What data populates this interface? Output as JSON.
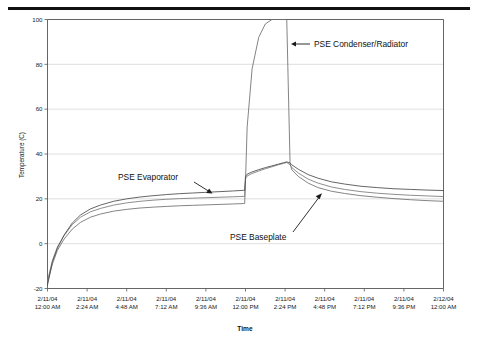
{
  "figure": {
    "top_rule": "horizontal-rule",
    "background": "#ffffff"
  },
  "chart_data": {
    "type": "line",
    "title": "",
    "xlabel": "Time",
    "ylabel": "Temperature (C)",
    "ylim": [
      -20,
      100
    ],
    "yticks": [
      -20,
      0,
      20,
      40,
      60,
      80,
      100
    ],
    "ytick_labels": [
      "-20",
      "0",
      "20",
      "40",
      "60",
      "80",
      "100"
    ],
    "grid": "horizontal",
    "legend_position": "inline-annotations",
    "xtick_labels": [
      {
        "date": "2/11/04",
        "time": "12:00 AM"
      },
      {
        "date": "2/11/04",
        "time": "2:24 AM"
      },
      {
        "date": "2/11/04",
        "time": "4:48 AM"
      },
      {
        "date": "2/11/04",
        "time": "7:12 AM"
      },
      {
        "date": "2/11/04",
        "time": "9:36 AM"
      },
      {
        "date": "2/11/04",
        "time": "12:00 PM"
      },
      {
        "date": "2/11/04",
        "time": "2:24 PM"
      },
      {
        "date": "2/11/04",
        "time": "4:48 PM"
      },
      {
        "date": "2/11/04",
        "time": "7:12 PM"
      },
      {
        "date": "2/11/04",
        "time": "9:36 PM"
      },
      {
        "date": "2/12/04",
        "time": "12:00 AM"
      }
    ],
    "x": [
      0,
      0.3,
      0.6,
      1.0,
      1.5,
      2.0,
      2.6,
      3.2,
      4.0,
      4.8,
      5.6,
      6.4,
      7.2,
      8.0,
      8.8,
      9.6,
      10.4,
      11.2,
      11.9,
      11.95,
      12.0,
      12.1,
      12.4,
      12.8,
      13.2,
      13.6,
      14.0,
      14.3,
      14.5,
      14.7,
      14.75,
      14.8,
      15.2,
      15.8,
      16.4,
      17.2,
      18.0,
      19.0,
      20.0,
      21.0,
      22.0,
      23.0,
      24.0
    ],
    "series": [
      {
        "name": "PSE Condenser/Radiator",
        "color": "#6e6e6e",
        "values": [
          -17.5,
          -9.0,
          -3.0,
          2.0,
          6.5,
          9.5,
          11.8,
          13.2,
          14.5,
          15.3,
          15.9,
          16.3,
          16.6,
          16.9,
          17.1,
          17.3,
          17.5,
          17.7,
          17.9,
          17.9,
          28.0,
          52.0,
          78.0,
          92.0,
          98.0,
          100.0,
          100.0,
          100.0,
          100.0,
          36.0,
          34.5,
          33.0,
          30.0,
          27.0,
          25.0,
          23.4,
          22.4,
          21.4,
          20.7,
          20.1,
          19.6,
          19.2,
          18.9
        ]
      },
      {
        "name": "PSE Evaporator",
        "color": "#7a7a7a",
        "values": [
          -16.5,
          -7.5,
          -1.5,
          3.5,
          8.5,
          11.8,
          14.2,
          15.7,
          17.2,
          18.2,
          18.9,
          19.4,
          19.8,
          20.1,
          20.3,
          20.5,
          20.7,
          20.9,
          21.1,
          21.1,
          29.0,
          30.2,
          31.3,
          32.4,
          33.4,
          34.3,
          35.2,
          35.8,
          36.2,
          35.2,
          34.6,
          34.0,
          31.5,
          28.8,
          27.0,
          25.3,
          24.2,
          23.2,
          22.5,
          22.0,
          21.6,
          21.3,
          21.0
        ]
      },
      {
        "name": "PSE Baseplate",
        "color": "#4a4a4a",
        "values": [
          -18.5,
          -8.0,
          -2.0,
          3.8,
          9.2,
          12.8,
          15.5,
          17.2,
          18.9,
          20.0,
          20.8,
          21.4,
          21.9,
          22.3,
          22.6,
          22.9,
          23.2,
          23.5,
          23.8,
          23.8,
          30.0,
          31.0,
          32.0,
          33.0,
          33.9,
          34.7,
          35.5,
          36.1,
          36.5,
          36.0,
          35.6,
          35.2,
          33.2,
          30.8,
          29.2,
          27.6,
          26.6,
          25.6,
          25.0,
          24.5,
          24.2,
          23.9,
          23.7
        ]
      }
    ],
    "annotations": [
      {
        "label": "PSE Condenser/Radiator",
        "arrow": "left-arrow"
      },
      {
        "label": "PSE Baseplate",
        "arrow": "diagonal-down-right-arrow"
      },
      {
        "label": "PSE Evaporator",
        "arrow": "diagonal-up-right-arrow"
      }
    ]
  }
}
